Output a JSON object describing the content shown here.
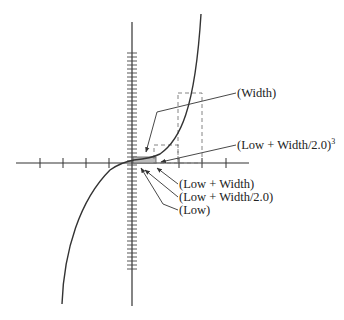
{
  "diagram": {
    "type": "cubic-function-interval-illustration",
    "function": "y = x^3",
    "labels": {
      "width": "(Width)",
      "midpoint_cubed": "(Low + Width/2.0)",
      "midpoint_cubed_exponent": "3",
      "low_plus_width": "(Low + Width)",
      "low_plus_half_width": "(Low + Width/2.0)",
      "low": "(Low)"
    },
    "colors": {
      "axis": "#333333",
      "curve": "#333333",
      "dashed_box": "#777777",
      "shaded_region": "#bbbbbb",
      "text": "#222222"
    },
    "axes": {
      "x_axis": {
        "x1": 16,
        "x2": 249,
        "y": 163,
        "ticks_x": [
          40,
          63,
          86,
          109,
          179,
          202,
          226
        ]
      },
      "y_axis": {
        "x": 132,
        "y1": 22,
        "y2": 306,
        "tick_y_start": 53,
        "tick_y_end": 271,
        "tick_spacing": 4
      }
    }
  }
}
